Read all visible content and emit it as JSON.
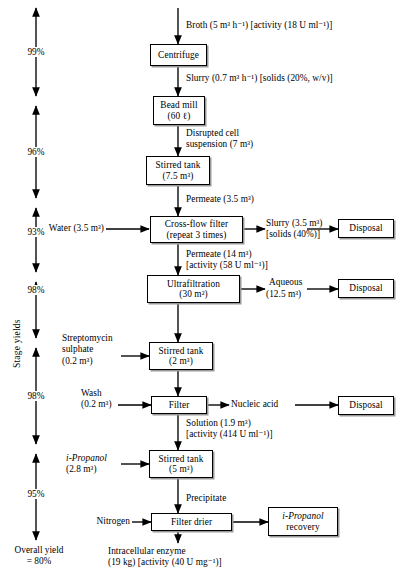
{
  "stage_yields": {
    "axis_label": "Stage yields",
    "values": [
      "99%",
      "96%",
      "93%",
      "98%",
      "98%",
      "95%"
    ],
    "overall_line1": "Overall yield",
    "overall_line2": "= 80%"
  },
  "nodes": [
    {
      "id": "centrifuge",
      "line1": "Centrifuge",
      "line2": ""
    },
    {
      "id": "bead-mill",
      "line1": "Bead mill",
      "line2": "(60 ℓ)"
    },
    {
      "id": "stirred-tank-1",
      "line1": "Stirred tank",
      "line2": "(7.5 m³)"
    },
    {
      "id": "cross-flow-filter",
      "line1": "Cross-flow filter",
      "line2": "(repeat 3 times)"
    },
    {
      "id": "ultrafiltration",
      "line1": "Ultrafiltration",
      "line2": "(30 m²)"
    },
    {
      "id": "stirred-tank-2",
      "line1": "Stirred tank",
      "line2": "(2 m³)"
    },
    {
      "id": "filter",
      "line1": "Filter",
      "line2": ""
    },
    {
      "id": "stirred-tank-3",
      "line1": "Stirred tank",
      "line2": "(5 m³)"
    },
    {
      "id": "filter-drier",
      "line1": "Filter drier",
      "line2": ""
    },
    {
      "id": "disposal-1",
      "line1": "Disposal",
      "line2": ""
    },
    {
      "id": "disposal-2",
      "line1": "Disposal",
      "line2": ""
    },
    {
      "id": "disposal-3",
      "line1": "Disposal",
      "line2": ""
    },
    {
      "id": "propanol-recovery",
      "line1": "i-Propanol",
      "line2": "recovery"
    }
  ],
  "streams": {
    "broth": "Broth (5 m³ h⁻¹) [activity (18 U ml⁻¹)]",
    "slurry_centrifuge": "Slurry (0.7 m³ h⁻¹) [solids (20%, w/v)]",
    "disrupted_l1": "Disrupted cell",
    "disrupted_l2": "suspension (7 m³)",
    "permeate_small": "Permeate (3.5 m³)",
    "water": "Water (3.5 m³)",
    "slurry_cff_l1": "Slurry (3.5 m³)",
    "slurry_cff_l2": "[solids (40%)]",
    "permeate_big_l1": "Permeate (14 m³)",
    "permeate_big_l2": "[activity (58 U ml⁻¹)]",
    "aqueous_l1": "Aqueous",
    "aqueous_l2": "(12.5 m³)",
    "streptomycin_l1": "Streptomycin",
    "streptomycin_l2": "sulphate",
    "streptomycin_l3": "(0.2 m³)",
    "wash_l1": "Wash",
    "wash_l2": "(0.2 m³)",
    "nucleic_acid": "Nucleic acid",
    "solution_l1": "Solution (1.9 m³)",
    "solution_l2": "[activity (414 U ml⁻¹)]",
    "propanol_in_l1": "i-Propanol",
    "propanol_in_l2": "(2.8 m³)",
    "precipitate": "Precipitate",
    "nitrogen": "Nitrogen",
    "product_l1": "Intracellular enzyme",
    "product_l2": "(19 kg) [activity (40 U mg⁻¹)]"
  },
  "colors": {
    "line": "#000000",
    "shadow": "#9a9a9a",
    "background": "#ffffff"
  }
}
